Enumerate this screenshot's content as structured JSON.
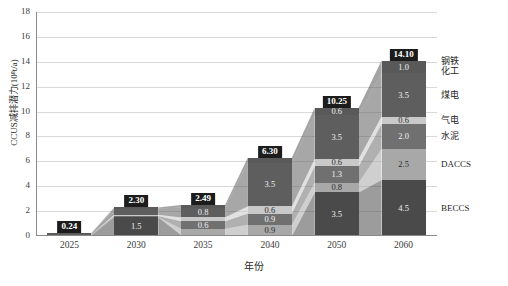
{
  "chart_data": {
    "type": "bar",
    "title": "",
    "xlabel": "年份",
    "ylabel": "CCUS减排潜力(10⁸t/a)",
    "categories": [
      "2025",
      "2030",
      "2035",
      "2040",
      "2050",
      "2060"
    ],
    "ylim": [
      0,
      18
    ],
    "yticks": [
      "0",
      "2",
      "4",
      "6",
      "8",
      "10",
      "12",
      "14",
      "16",
      "18"
    ],
    "grid": true,
    "legend_position": "right",
    "stacked": true,
    "totals": [
      "0.24",
      "2.30",
      "2.49",
      "6.30",
      "10.25",
      "14.10"
    ],
    "series": [
      {
        "name": "钢铁化工",
        "color": "#595959",
        "values": [
          0.04,
          0.1,
          0.2,
          0.4,
          0.6,
          1.0
        ],
        "labels": [
          "",
          "",
          "",
          "",
          "0.6",
          "1.0"
        ]
      },
      {
        "name": "煤电",
        "color": "#5e5e5e",
        "values": [
          0.1,
          0.5,
          0.8,
          3.5,
          3.5,
          3.5
        ],
        "labels": [
          "",
          "0.5",
          "0.8",
          "3.5",
          "3.5",
          "3.5"
        ]
      },
      {
        "name": "气电",
        "color": "#c9c9c9",
        "values": [
          0.0,
          0.1,
          0.3,
          0.6,
          0.6,
          0.6
        ],
        "labels": [
          "",
          "",
          "",
          "0.6",
          "0.6",
          "0.6"
        ]
      },
      {
        "name": "水泥",
        "color": "#707070",
        "values": [
          0.05,
          0.1,
          0.6,
          0.9,
          1.3,
          2.0
        ],
        "labels": [
          "",
          "",
          "0.6",
          "0.9",
          "1.3",
          "2.0"
        ]
      },
      {
        "name": "DACCS",
        "color": "#a8a8a8",
        "values": [
          0.0,
          0.0,
          0.5,
          0.9,
          0.8,
          2.5
        ],
        "labels": [
          "",
          "",
          "0.5",
          "0.9",
          "0.8",
          "2.5"
        ]
      },
      {
        "name": "BECCS",
        "color": "#4a4a4a",
        "values": [
          0.05,
          1.5,
          0.09,
          0.0,
          3.5,
          4.5
        ],
        "labels": [
          "",
          "1.5",
          "",
          "",
          "3.5",
          "4.5"
        ]
      }
    ]
  }
}
